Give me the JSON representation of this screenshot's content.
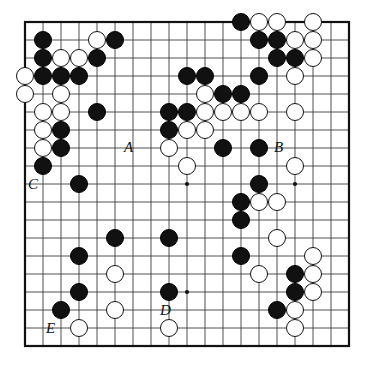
{
  "figure": {
    "kind": "go-board-diagram",
    "board_size": 19,
    "background_color": "#ffffff",
    "line_color": "#3c3c3c",
    "border_color": "#111111",
    "black_stone_color": "#111111",
    "white_stone_color": "#ffffff",
    "white_stone_border_color": "#141414"
  },
  "geometry": {
    "origin_x": 25,
    "origin_y": 22,
    "cell": 18,
    "stone_radius": 9.3,
    "star_radius": 2.1
  },
  "star_points": [
    {
      "col": 3,
      "row": 3
    },
    {
      "col": 9,
      "row": 3
    },
    {
      "col": 15,
      "row": 3
    },
    {
      "col": 3,
      "row": 9
    },
    {
      "col": 9,
      "row": 9
    },
    {
      "col": 15,
      "row": 9
    },
    {
      "col": 3,
      "row": 15
    },
    {
      "col": 9,
      "row": 15
    },
    {
      "col": 15,
      "row": 15
    }
  ],
  "stones": [
    {
      "col": 12,
      "row": 0,
      "color": "black"
    },
    {
      "col": 13,
      "row": 0,
      "color": "white"
    },
    {
      "col": 14,
      "row": 0,
      "color": "white"
    },
    {
      "col": 16,
      "row": 0,
      "color": "white"
    },
    {
      "col": 1,
      "row": 1,
      "color": "black"
    },
    {
      "col": 4,
      "row": 1,
      "color": "white"
    },
    {
      "col": 5,
      "row": 1,
      "color": "black"
    },
    {
      "col": 13,
      "row": 1,
      "color": "black"
    },
    {
      "col": 14,
      "row": 1,
      "color": "black"
    },
    {
      "col": 15,
      "row": 1,
      "color": "white"
    },
    {
      "col": 16,
      "row": 1,
      "color": "white"
    },
    {
      "col": 1,
      "row": 2,
      "color": "black"
    },
    {
      "col": 2,
      "row": 2,
      "color": "white"
    },
    {
      "col": 3,
      "row": 2,
      "color": "white"
    },
    {
      "col": 4,
      "row": 2,
      "color": "black"
    },
    {
      "col": 14,
      "row": 2,
      "color": "black"
    },
    {
      "col": 15,
      "row": 2,
      "color": "black"
    },
    {
      "col": 16,
      "row": 2,
      "color": "white"
    },
    {
      "col": 0,
      "row": 3,
      "color": "white"
    },
    {
      "col": 1,
      "row": 3,
      "color": "black"
    },
    {
      "col": 2,
      "row": 3,
      "color": "black"
    },
    {
      "col": 3,
      "row": 3,
      "color": "black"
    },
    {
      "col": 9,
      "row": 3,
      "color": "black"
    },
    {
      "col": 10,
      "row": 3,
      "color": "black"
    },
    {
      "col": 13,
      "row": 3,
      "color": "black"
    },
    {
      "col": 15,
      "row": 3,
      "color": "white"
    },
    {
      "col": 0,
      "row": 4,
      "color": "white"
    },
    {
      "col": 2,
      "row": 4,
      "color": "white"
    },
    {
      "col": 10,
      "row": 4,
      "color": "white"
    },
    {
      "col": 11,
      "row": 4,
      "color": "black"
    },
    {
      "col": 12,
      "row": 4,
      "color": "black"
    },
    {
      "col": 1,
      "row": 5,
      "color": "white"
    },
    {
      "col": 2,
      "row": 5,
      "color": "white"
    },
    {
      "col": 4,
      "row": 5,
      "color": "black"
    },
    {
      "col": 8,
      "row": 5,
      "color": "black"
    },
    {
      "col": 9,
      "row": 5,
      "color": "black"
    },
    {
      "col": 10,
      "row": 5,
      "color": "white"
    },
    {
      "col": 11,
      "row": 5,
      "color": "white"
    },
    {
      "col": 12,
      "row": 5,
      "color": "white"
    },
    {
      "col": 13,
      "row": 5,
      "color": "white"
    },
    {
      "col": 15,
      "row": 5,
      "color": "white"
    },
    {
      "col": 1,
      "row": 6,
      "color": "white"
    },
    {
      "col": 2,
      "row": 6,
      "color": "black"
    },
    {
      "col": 8,
      "row": 6,
      "color": "black"
    },
    {
      "col": 9,
      "row": 6,
      "color": "white"
    },
    {
      "col": 10,
      "row": 6,
      "color": "white"
    },
    {
      "col": 1,
      "row": 7,
      "color": "white"
    },
    {
      "col": 2,
      "row": 7,
      "color": "black"
    },
    {
      "col": 8,
      "row": 7,
      "color": "white"
    },
    {
      "col": 11,
      "row": 7,
      "color": "black"
    },
    {
      "col": 13,
      "row": 7,
      "color": "black"
    },
    {
      "col": 1,
      "row": 8,
      "color": "black"
    },
    {
      "col": 9,
      "row": 8,
      "color": "white"
    },
    {
      "col": 15,
      "row": 8,
      "color": "white"
    },
    {
      "col": 3,
      "row": 9,
      "color": "black"
    },
    {
      "col": 13,
      "row": 9,
      "color": "black"
    },
    {
      "col": 12,
      "row": 10,
      "color": "black"
    },
    {
      "col": 13,
      "row": 10,
      "color": "white"
    },
    {
      "col": 14,
      "row": 10,
      "color": "white"
    },
    {
      "col": 12,
      "row": 11,
      "color": "black"
    },
    {
      "col": 5,
      "row": 12,
      "color": "black"
    },
    {
      "col": 8,
      "row": 12,
      "color": "black"
    },
    {
      "col": 14,
      "row": 12,
      "color": "white"
    },
    {
      "col": 3,
      "row": 13,
      "color": "black"
    },
    {
      "col": 12,
      "row": 13,
      "color": "black"
    },
    {
      "col": 16,
      "row": 13,
      "color": "white"
    },
    {
      "col": 5,
      "row": 14,
      "color": "white"
    },
    {
      "col": 13,
      "row": 14,
      "color": "white"
    },
    {
      "col": 15,
      "row": 14,
      "color": "black"
    },
    {
      "col": 16,
      "row": 14,
      "color": "white"
    },
    {
      "col": 3,
      "row": 15,
      "color": "black"
    },
    {
      "col": 8,
      "row": 15,
      "color": "black"
    },
    {
      "col": 15,
      "row": 15,
      "color": "black"
    },
    {
      "col": 16,
      "row": 15,
      "color": "white"
    },
    {
      "col": 2,
      "row": 16,
      "color": "black"
    },
    {
      "col": 5,
      "row": 16,
      "color": "white"
    },
    {
      "col": 14,
      "row": 16,
      "color": "black"
    },
    {
      "col": 15,
      "row": 16,
      "color": "white"
    },
    {
      "col": 3,
      "row": 17,
      "color": "white"
    },
    {
      "col": 8,
      "row": 17,
      "color": "white"
    },
    {
      "col": 15,
      "row": 17,
      "color": "white"
    }
  ],
  "labels": [
    {
      "text": "A",
      "col": 6,
      "row": 7,
      "dx": -4,
      "dy": -1,
      "name": "point-label-a"
    },
    {
      "text": "B",
      "col": 14,
      "row": 7,
      "dx": 2,
      "dy": -1,
      "name": "point-label-b"
    },
    {
      "text": "C",
      "col": 1,
      "row": 9,
      "dx": -10,
      "dy": 0,
      "name": "point-label-c"
    },
    {
      "text": "D",
      "col": 8,
      "row": 16,
      "dx": -4,
      "dy": 0,
      "name": "point-label-d"
    },
    {
      "text": "E",
      "col": 2,
      "row": 17,
      "dx": -10,
      "dy": 0,
      "name": "point-label-e"
    }
  ]
}
